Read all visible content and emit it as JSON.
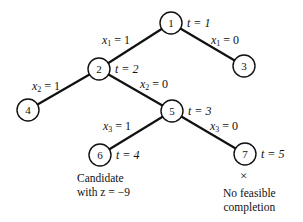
{
  "diagram": {
    "type": "branch-and-bound-tree",
    "nodes": [
      {
        "id": "1",
        "x": 171,
        "y": 23,
        "t_label": "t = 1"
      },
      {
        "id": "2",
        "x": 99,
        "y": 69,
        "t_label": "t = 2"
      },
      {
        "id": "3",
        "x": 244,
        "y": 66,
        "t_label": ""
      },
      {
        "id": "4",
        "x": 28,
        "y": 110,
        "t_label": ""
      },
      {
        "id": "5",
        "x": 172,
        "y": 111,
        "t_label": "t = 3"
      },
      {
        "id": "6",
        "x": 100,
        "y": 155,
        "t_label": "t = 4"
      },
      {
        "id": "7",
        "x": 245,
        "y": 154,
        "t_label": "t = 5"
      }
    ],
    "edges": [
      {
        "from": "1",
        "to": "2",
        "var": "x",
        "sub": "1",
        "value": "= 1"
      },
      {
        "from": "1",
        "to": "3",
        "var": "x",
        "sub": "1",
        "value": "= 0"
      },
      {
        "from": "2",
        "to": "4",
        "var": "x",
        "sub": "2",
        "value": "= 1"
      },
      {
        "from": "2",
        "to": "5",
        "var": "x",
        "sub": "2",
        "value": "= 0"
      },
      {
        "from": "5",
        "to": "6",
        "var": "x",
        "sub": "3",
        "value": "= 1"
      },
      {
        "from": "5",
        "to": "7",
        "var": "x",
        "sub": "3",
        "value": "= 0"
      }
    ],
    "annotations": {
      "node6_line1": "Candidate",
      "node6_line2": "with z = −9",
      "node7_mark": "×",
      "node7_line1": "No feasible",
      "node7_line2": "completion"
    }
  }
}
